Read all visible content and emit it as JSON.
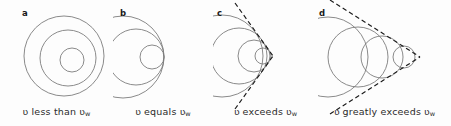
{
  "figure": {
    "background_color": "#fdfdfd",
    "wavefront_color": "#7d7d7d",
    "cone_color": "#1a1a1a",
    "text_color": "#2b2b2b",
    "width": 451,
    "height": 126
  },
  "symbols": {
    "speed": "ʋ",
    "wave_subscript": "w"
  },
  "panels": [
    {
      "letter": "a",
      "caption_before": "ʋ",
      "caption_text": "less than",
      "caption_after": "ʋ",
      "caption_sub": "w",
      "caption_full": "ʋ less than ʋw",
      "condition": "source speed less than wave speed",
      "mach_cone": false,
      "source_at_center": true,
      "wavefronts": [
        {
          "cx": 64,
          "cy": 56,
          "r": 40
        },
        {
          "cx": 68,
          "cy": 58,
          "r": 28
        },
        {
          "cx": 72,
          "cy": 60,
          "r": 12
        }
      ]
    },
    {
      "letter": "b",
      "caption_before": "ʋ",
      "caption_text": "equals",
      "caption_after": "ʋ",
      "caption_sub": "w",
      "caption_full": "ʋ equals ʋw",
      "condition": "source speed equals wave speed",
      "mach_cone": false,
      "source_at_center": false,
      "wavefronts": [
        {
          "cx": 123,
          "cy": 57,
          "r": 41
        },
        {
          "cx": 136,
          "cy": 57,
          "r": 28
        },
        {
          "cx": 152,
          "cy": 57,
          "r": 12
        }
      ]
    },
    {
      "letter": "c",
      "caption_before": "ʋ",
      "caption_text": "exceeds",
      "caption_after": "ʋ",
      "caption_sub": "w",
      "caption_full": "ʋ exceeds ʋw",
      "condition": "source speed exceeds wave speed",
      "mach_cone": true,
      "cone_half_angle_deg": 42,
      "source_at_center": false,
      "wavefronts": [
        {
          "cx": 222,
          "cy": 56,
          "r": 41
        },
        {
          "cx": 239,
          "cy": 56,
          "r": 28
        },
        {
          "cx": 254,
          "cy": 56,
          "r": 16
        },
        {
          "cx": 263,
          "cy": 56,
          "r": 8
        }
      ],
      "apex": {
        "x": 273,
        "y": 56
      }
    },
    {
      "letter": "d",
      "caption_before": "ʋ",
      "caption_text": "greatly exceeds",
      "caption_after": "ʋ",
      "caption_sub": "w",
      "caption_full": "ʋ greatly exceeds ʋw",
      "condition": "source speed greatly exceeds wave speed",
      "mach_cone": true,
      "cone_half_angle_deg": 26,
      "source_at_center": false,
      "wavefronts": [
        {
          "cx": 328,
          "cy": 57,
          "r": 40
        },
        {
          "cx": 358,
          "cy": 57,
          "r": 30
        },
        {
          "cx": 382,
          "cy": 57,
          "r": 21
        },
        {
          "cx": 404,
          "cy": 57,
          "r": 11
        }
      ],
      "apex": {
        "x": 420,
        "y": 57
      }
    }
  ]
}
